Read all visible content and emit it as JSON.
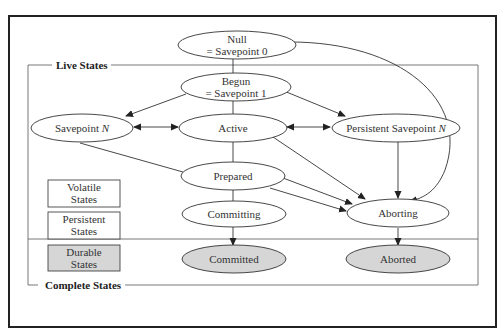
{
  "groups": {
    "live": {
      "label": "Live States"
    },
    "complete": {
      "label": "Complete States"
    }
  },
  "legend": {
    "volatile": {
      "line1": "Volatile",
      "line2": "States"
    },
    "persistent": {
      "line1": "Persistent",
      "line2": "States"
    },
    "durable": {
      "line1": "Durable",
      "line2": "States"
    }
  },
  "nodes": {
    "null": {
      "line1": "Null",
      "line2": "= Savepoint 0"
    },
    "begun": {
      "line1": "Begun",
      "line2": "= Savepoint 1"
    },
    "savepoint_n": {
      "label": "Savepoint ",
      "italic": "N"
    },
    "active": {
      "label": "Active"
    },
    "persistent_savepoint_n": {
      "label": "Persistent Savepoint ",
      "italic": "N"
    },
    "prepared": {
      "label": "Prepared"
    },
    "committing": {
      "label": "Committing"
    },
    "aborting": {
      "label": "Aborting"
    },
    "committed": {
      "label": "Committed"
    },
    "aborted": {
      "label": "Aborted"
    }
  },
  "edges": [
    {
      "from": "null",
      "to": "begun"
    },
    {
      "from": "null",
      "to": "aborting"
    },
    {
      "from": "begun",
      "to": "savepoint_n"
    },
    {
      "from": "begun",
      "to": "active"
    },
    {
      "from": "begun",
      "to": "persistent_savepoint_n"
    },
    {
      "from": "savepoint_n",
      "to": "active",
      "bidirectional": true
    },
    {
      "from": "active",
      "to": "persistent_savepoint_n",
      "bidirectional": true
    },
    {
      "from": "savepoint_n",
      "to": "aborting"
    },
    {
      "from": "active",
      "to": "prepared"
    },
    {
      "from": "active",
      "to": "aborting"
    },
    {
      "from": "persistent_savepoint_n",
      "to": "aborting"
    },
    {
      "from": "prepared",
      "to": "committing"
    },
    {
      "from": "prepared",
      "to": "aborting"
    },
    {
      "from": "committing",
      "to": "committed"
    },
    {
      "from": "aborting",
      "to": "aborted"
    }
  ],
  "colors": {
    "line": "#333333",
    "durable_fill": "#d6d6d6",
    "frame": "#222222"
  }
}
